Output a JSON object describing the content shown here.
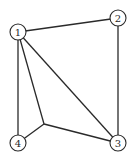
{
  "diagram": {
    "type": "graph",
    "nodes": [
      {
        "id": "1",
        "label": "1",
        "x": 18,
        "y": 32
      },
      {
        "id": "2",
        "label": "2",
        "x": 118,
        "y": 18
      },
      {
        "id": "3",
        "label": "3",
        "x": 118,
        "y": 143
      },
      {
        "id": "4",
        "label": "4",
        "x": 18,
        "y": 143
      },
      {
        "id": "j",
        "label": "",
        "x": 44,
        "y": 124
      }
    ],
    "edges": [
      [
        "1",
        "2"
      ],
      [
        "2",
        "3"
      ],
      [
        "1",
        "4"
      ],
      [
        "1",
        "3"
      ],
      [
        "1",
        "j"
      ],
      [
        "j",
        "4"
      ],
      [
        "j",
        "3"
      ]
    ],
    "colors": {
      "stroke": "#2a2a2a",
      "node_fill": "#ffffff",
      "background": "#ffffff"
    }
  }
}
